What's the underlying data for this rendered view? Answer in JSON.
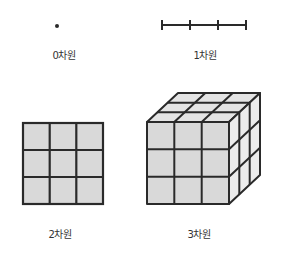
{
  "figures": [
    {
      "id": "0d",
      "label": "0차원",
      "shape": "point"
    },
    {
      "id": "1d",
      "label": "1차원",
      "shape": "segmented line (3 segments)"
    },
    {
      "id": "2d",
      "label": "2차원",
      "shape": "3x3 square grid"
    },
    {
      "id": "3d",
      "label": "3차원",
      "shape": "3x3x3 cube"
    }
  ],
  "colors": {
    "stroke": "#2a2a2a",
    "fill": "#d9d9d9",
    "fill_top": "#e4e4e4",
    "fill_side": "#ececec"
  }
}
